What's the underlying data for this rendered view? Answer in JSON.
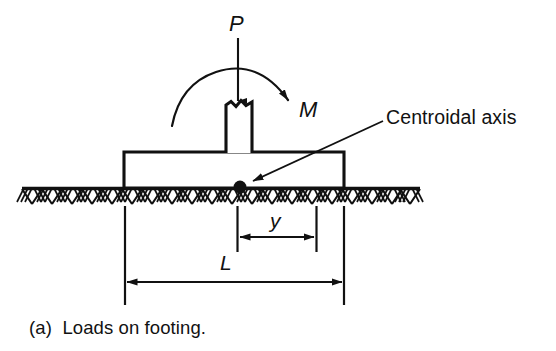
{
  "figure": {
    "caption": "(a)  Loads on footing.",
    "labels": {
      "axial_load": "P",
      "moment": "M",
      "eccentricity": "y",
      "footing_length": "L",
      "centroidal_axis": "Centroidal axis"
    },
    "colors": {
      "line": "#111111",
      "background": "#ffffff",
      "dot": "#111111"
    },
    "geometry": {
      "footing": {
        "x1": 124,
        "y1": 152,
        "x2": 344,
        "y2": 188
      },
      "column": {
        "x1": 226,
        "y1": 103,
        "x2": 252,
        "y2": 152
      },
      "ground_line": {
        "x1": 22,
        "y": 188,
        "x2": 420
      },
      "centroid_dot": {
        "cx": 240,
        "cy": 187,
        "r": 6
      },
      "load_arrow": {
        "x": 238,
        "y1": 38,
        "y2": 104
      },
      "moment_arc": {
        "start_x": 172,
        "start_y": 126,
        "apex_x": 238,
        "apex_y": 70,
        "end_x": 294,
        "end_y": 105
      },
      "leader_line": {
        "x1": 383,
        "y1": 121,
        "x2": 249,
        "y2": 184
      },
      "dim_y": {
        "x1": 237,
        "x2": 316,
        "y": 237,
        "ext_top": 206,
        "ext_bottom": 252
      },
      "dim_L": {
        "x1": 124,
        "x2": 344,
        "y": 282,
        "ext_top": 206,
        "ext_bottom": 305
      }
    }
  }
}
